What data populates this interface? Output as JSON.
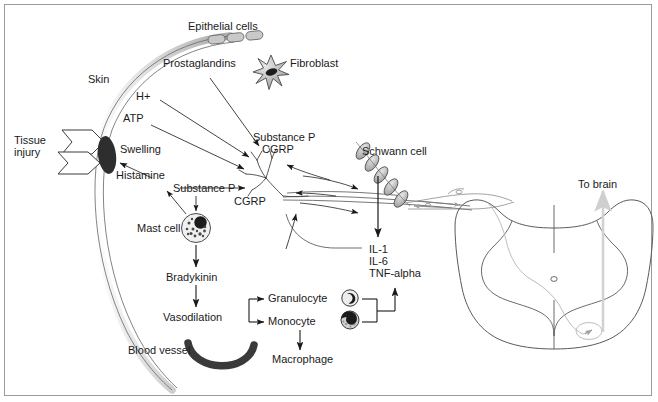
{
  "figure": {
    "background_color": "#ffffff",
    "border_color": "#9a9a9a",
    "ink_color": "#1a1a1a",
    "cell_fill_color": "#9b9b9b",
    "dark_fill_color": "#2b2b2b",
    "faint_color": "#c8c8c8"
  },
  "labels": {
    "epithelial_cells": "Epithelial cells",
    "prostaglandins": "Prostaglandins",
    "fibroblast": "Fibroblast",
    "skin": "Skin",
    "h_plus": "H+",
    "atp": "ATP",
    "tissue_injury_line1": "Tissue",
    "tissue_injury_line2": "injury",
    "swelling": "Swelling",
    "histamine": "Histamine",
    "substance_p_upper_line1": "Substance P",
    "substance_p_upper_line2": "CGRP",
    "substance_p_lower": "Substance P",
    "cgrp_lower": "CGRP",
    "schwann_cell": "Schwann cell",
    "to_brain": "To brain",
    "mast_cell": "Mast cell",
    "bradykinin": "Bradykinin",
    "vasodilation": "Vasodilation",
    "blood_vessel": "Blood vessel",
    "granulocyte": "Granulocyte",
    "monocyte": "Monocyte",
    "macrophage": "Macrophage",
    "cytokine_il1": "IL-1",
    "cytokine_il6": "IL-6",
    "cytokine_tnf": "TNF-alpha"
  }
}
